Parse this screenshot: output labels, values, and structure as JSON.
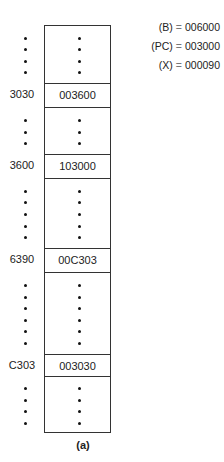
{
  "diagram": {
    "memory_rows": [
      {
        "address": "3030",
        "content": "003600"
      },
      {
        "address": "3600",
        "content": "103000"
      },
      {
        "address": "6390",
        "content": "00C303"
      },
      {
        "address": "C303",
        "content": "003030"
      }
    ],
    "registers": [
      {
        "name": "(B)",
        "eq": "=",
        "value": "006000"
      },
      {
        "name": "(PC)",
        "eq": "=",
        "value": "003000"
      },
      {
        "name": "(X)",
        "eq": "=",
        "value": "000090"
      }
    ],
    "caption": "(a)",
    "ellipsis_segments": [
      {
        "dots": 4
      },
      {
        "dots": 3
      },
      {
        "dots": 5
      },
      {
        "dots": 6
      },
      {
        "dots": 4
      }
    ]
  }
}
